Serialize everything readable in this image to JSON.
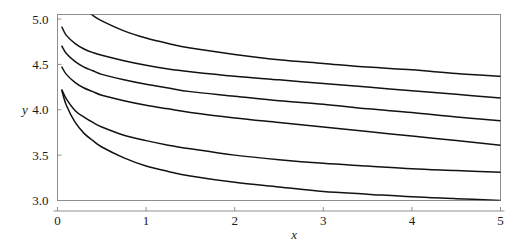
{
  "chart_data": {
    "type": "line",
    "title": "",
    "subtitle": "",
    "xlabel": "x",
    "ylabel": "y",
    "xlim": [
      0,
      5
    ],
    "ylim": [
      3.0,
      5.05
    ],
    "grid": false,
    "legend": null,
    "legend_position": "none",
    "x_ticks": [
      0,
      1,
      2,
      3,
      4,
      5
    ],
    "x_tick_labels": [
      "0",
      "1",
      "2",
      "3",
      "4",
      "5"
    ],
    "y_ticks": [
      3.0,
      3.5,
      4.0,
      4.5,
      5.0
    ],
    "y_tick_labels": [
      "3.0",
      "3.5",
      "4.0",
      "4.5",
      "5.0"
    ],
    "line_color": "#121212",
    "frame_color": "#8e8e8e",
    "background_color": "#ffffff",
    "x": [
      0.05,
      0.1,
      0.2,
      0.3,
      0.4,
      0.5,
      0.75,
      1.0,
      1.25,
      1.5,
      2.0,
      2.5,
      3.0,
      3.5,
      4.0,
      4.5,
      5.0
    ],
    "series": [
      {
        "name": "curve-1",
        "values": [
          5.62,
          5.42,
          5.23,
          5.12,
          5.04,
          4.98,
          4.87,
          4.79,
          4.73,
          4.68,
          4.61,
          4.55,
          4.51,
          4.47,
          4.44,
          4.4,
          4.37
        ]
      },
      {
        "name": "curve-2",
        "values": [
          4.91,
          4.82,
          4.73,
          4.67,
          4.63,
          4.6,
          4.54,
          4.49,
          4.45,
          4.42,
          4.37,
          4.33,
          4.29,
          4.25,
          4.21,
          4.17,
          4.13
        ]
      },
      {
        "name": "curve-3",
        "values": [
          4.7,
          4.62,
          4.53,
          4.47,
          4.43,
          4.39,
          4.33,
          4.28,
          4.24,
          4.2,
          4.15,
          4.1,
          4.06,
          4.01,
          3.97,
          3.92,
          3.88
        ]
      },
      {
        "name": "curve-4",
        "values": [
          4.47,
          4.39,
          4.3,
          4.24,
          4.2,
          4.16,
          4.1,
          4.05,
          4.01,
          3.97,
          3.91,
          3.86,
          3.81,
          3.76,
          3.71,
          3.66,
          3.61
        ]
      },
      {
        "name": "curve-5",
        "values": [
          4.22,
          4.12,
          3.99,
          3.92,
          3.86,
          3.81,
          3.72,
          3.66,
          3.61,
          3.57,
          3.5,
          3.45,
          3.41,
          3.38,
          3.35,
          3.33,
          3.31
        ]
      },
      {
        "name": "curve-6",
        "values": [
          4.21,
          4.05,
          3.86,
          3.74,
          3.66,
          3.59,
          3.47,
          3.38,
          3.32,
          3.27,
          3.2,
          3.15,
          3.1,
          3.07,
          3.04,
          3.02,
          3.0
        ]
      }
    ]
  }
}
